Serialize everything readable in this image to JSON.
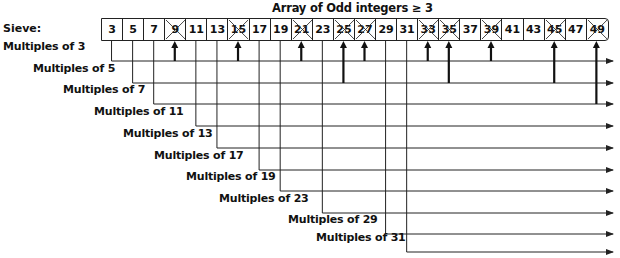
{
  "title": "Array of Odd integers ≥ 3",
  "sieve_label": "Sieve:",
  "array": {
    "values": [
      3,
      5,
      7,
      9,
      11,
      13,
      15,
      17,
      19,
      21,
      23,
      25,
      27,
      29,
      31,
      33,
      35,
      37,
      39,
      41,
      43,
      45,
      47,
      49
    ],
    "crossed_out": [
      9,
      15,
      21,
      25,
      27,
      33,
      35,
      39,
      45,
      49
    ]
  },
  "multiples": [
    {
      "prime": 3,
      "label": "Multiples of 3"
    },
    {
      "prime": 5,
      "label": "Multiples of 5"
    },
    {
      "prime": 7,
      "label": "Multiples of 7"
    },
    {
      "prime": 11,
      "label": "Multiples of 11"
    },
    {
      "prime": 13,
      "label": "Multiples of 13"
    },
    {
      "prime": 17,
      "label": "Multiples of 17"
    },
    {
      "prime": 19,
      "label": "Multiples of 19"
    },
    {
      "prime": 23,
      "label": "Multiples of 23"
    },
    {
      "prime": 29,
      "label": "Multiples of 29"
    },
    {
      "prime": 31,
      "label": "Multiples of 31"
    }
  ],
  "cross_arrows": [
    {
      "value": 9,
      "from_prime": 3
    },
    {
      "value": 15,
      "from_prime": 3
    },
    {
      "value": 21,
      "from_prime": 3
    },
    {
      "value": 25,
      "from_prime": 5
    },
    {
      "value": 27,
      "from_prime": 3
    },
    {
      "value": 33,
      "from_prime": 3
    },
    {
      "value": 35,
      "from_prime": 5
    },
    {
      "value": 39,
      "from_prime": 3
    },
    {
      "value": 45,
      "from_prime": 5
    },
    {
      "value": 49,
      "from_prime": 7
    }
  ],
  "colors": {
    "line": "#222222",
    "text": "#111111",
    "background": "#ffffff"
  }
}
